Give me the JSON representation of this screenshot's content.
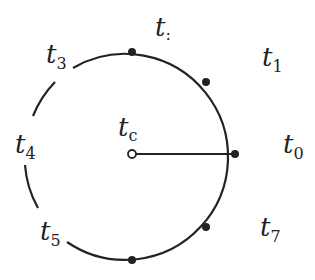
{
  "diagram": {
    "center_label": {
      "base": "t",
      "sub": "c"
    },
    "labels": [
      {
        "id": "t-top",
        "base": "t",
        "sub": ":"
      },
      {
        "id": "t1",
        "base": "t",
        "sub": "1"
      },
      {
        "id": "t0",
        "base": "t",
        "sub": "0"
      },
      {
        "id": "t7",
        "base": "t",
        "sub": "7"
      },
      {
        "id": "t5",
        "base": "t",
        "sub": "5"
      },
      {
        "id": "t4",
        "base": "t",
        "sub": "4"
      },
      {
        "id": "t3",
        "base": "t",
        "sub": "3"
      }
    ],
    "stroke_color": "#222222"
  }
}
